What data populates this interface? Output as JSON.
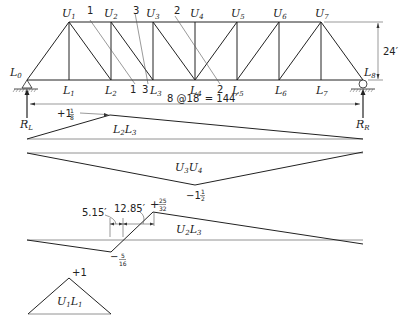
{
  "truss": {
    "upper_nodes": [
      "U1",
      "U2",
      "U3",
      "U4",
      "U5",
      "U6",
      "U7"
    ],
    "lower_nodes": [
      "L0",
      "L1",
      "L2",
      "L3",
      "L4",
      "L5",
      "L6",
      "L7",
      "L8"
    ],
    "height_label": "24′",
    "span_label": "8 @18′ = 144′",
    "section_labels": {
      "s1_top": "1",
      "s1_bot": "1",
      "s3_top": "3",
      "s3_bot": "3",
      "s2_top": "2",
      "s2_bot": "2"
    },
    "reactions": {
      "left": "R",
      "left_sub": "L",
      "right": "R",
      "right_sub": "R"
    }
  },
  "influence_lines": [
    {
      "member": "L2L3",
      "label_main": "L",
      "peak_label": "+1",
      "peak_frac_num": "1",
      "peak_frac_den": "8"
    },
    {
      "member": "U3U4",
      "peak_label": "−1",
      "peak_frac_num": "1",
      "peak_frac_den": "2"
    },
    {
      "member": "U2L3",
      "neg_label": "−",
      "neg_frac_num": "5",
      "neg_frac_den": "16",
      "pos_label": "+",
      "pos_frac_num": "25",
      "pos_frac_den": "32",
      "dim1": "5.15′",
      "dim2": "12.85′"
    },
    {
      "member": "U1L1",
      "peak_label": "+1"
    }
  ],
  "chart_data": {
    "type": "line",
    "series": [
      {
        "name": "L2L3",
        "x_panel_points": [
          0,
          2,
          8
        ],
        "values": [
          0,
          1.125,
          0
        ]
      },
      {
        "name": "U3U4",
        "x_panel_points": [
          0,
          4,
          8
        ],
        "values": [
          0,
          -1.5,
          0
        ]
      },
      {
        "name": "U2L3",
        "x_panel_points": [
          0,
          2,
          3,
          8
        ],
        "values": [
          0,
          -0.3125,
          0.78125,
          0
        ],
        "zero_crossing_ft": [
          5.15,
          12.85
        ]
      },
      {
        "name": "U1L1",
        "x_panel_points": [
          0,
          1,
          2
        ],
        "values": [
          0,
          1,
          0
        ]
      }
    ],
    "xlabel": "8 @18′ = 144′"
  }
}
